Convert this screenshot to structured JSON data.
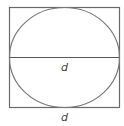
{
  "diagram": {
    "type": "circle-inscribed-in-square",
    "labels": {
      "diameter": "d",
      "side": "d"
    },
    "colors": {
      "stroke": "#6a6a6a",
      "label": "#444444",
      "background": "#ffffff"
    }
  }
}
